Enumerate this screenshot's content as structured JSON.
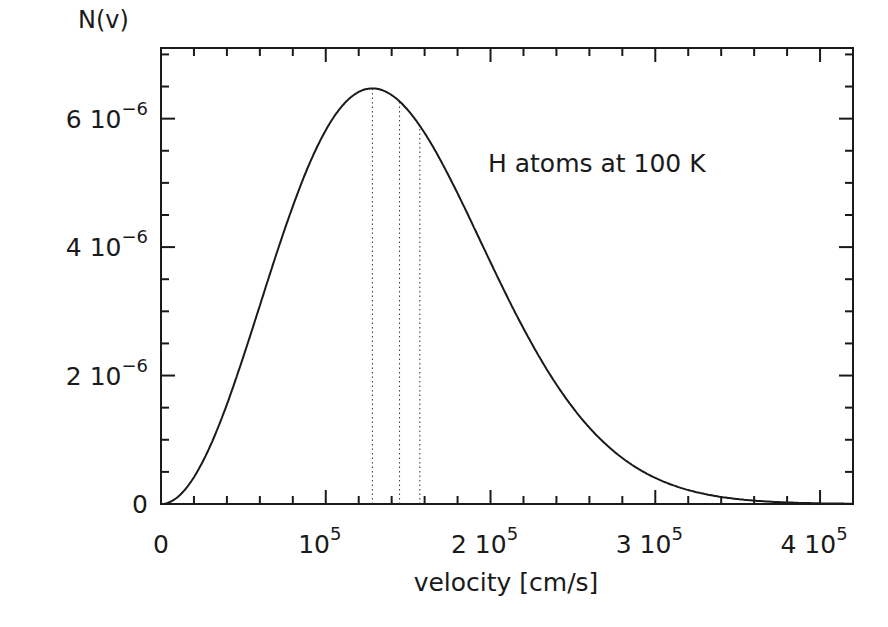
{
  "chart_data": {
    "type": "line",
    "title": "",
    "annotation": "H atoms at 100 K",
    "xlabel": "velocity [cm/s]",
    "ylabel": "N(v)",
    "xlim": [
      0,
      420000
    ],
    "ylim": [
      0,
      7.1e-06
    ],
    "grid": false,
    "legend": null,
    "x_ticks": [
      {
        "value": 0,
        "label": "0"
      },
      {
        "value": 100000,
        "label": "10",
        "exp": "5"
      },
      {
        "value": 200000,
        "label": "2 10",
        "exp": "5"
      },
      {
        "value": 300000,
        "label": "3 10",
        "exp": "5"
      },
      {
        "value": 400000,
        "label": "4 10",
        "exp": "5"
      }
    ],
    "y_ticks": [
      {
        "value": 0,
        "label": "0"
      },
      {
        "value": 2e-06,
        "label": "2 10",
        "exp": "−6"
      },
      {
        "value": 4e-06,
        "label": "4 10",
        "exp": "−6"
      },
      {
        "value": 6e-06,
        "label": "6 10",
        "exp": "−6"
      }
    ],
    "series": [
      {
        "name": "Maxwell-Boltzmann N(v), H at 100 K",
        "style": "solid",
        "most_probable_velocity": 128300,
        "x": [
          0,
          20000,
          40000,
          60000,
          80000,
          100000,
          120000,
          128300,
          140000,
          160000,
          180000,
          200000,
          220000,
          240000,
          260000,
          280000,
          300000,
          320000,
          340000,
          360000,
          380000,
          400000,
          420000
        ],
        "values": [
          0,
          5.4e-07,
          1.95e-06,
          3.67e-06,
          5.16e-06,
          6.07e-06,
          6.43e-06,
          6.45e-06,
          6.36e-06,
          5.83e-06,
          4.87e-06,
          3.77e-06,
          2.68e-06,
          1.76e-06,
          1.07e-06,
          6e-07,
          3.1e-07,
          1.5e-07,
          7e-08,
          3e-08,
          1e-08,
          0,
          0
        ]
      }
    ],
    "vertical_markers": [
      {
        "name": "most probable velocity",
        "x": 128300,
        "style": "dotted"
      },
      {
        "name": "mean velocity",
        "x": 144800,
        "style": "dotted"
      },
      {
        "name": "rms velocity",
        "x": 157100,
        "style": "dotted"
      }
    ]
  },
  "labels": {
    "ylabel": "N(v)",
    "xlabel": "velocity [cm/s]",
    "annotation": "H atoms at 100 K"
  }
}
